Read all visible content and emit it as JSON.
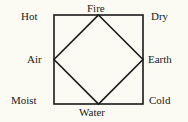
{
  "diagram": {
    "corners": {
      "top_left": "Hot",
      "top_right": "Dry",
      "bottom_left": "Moist",
      "bottom_right": "Cold"
    },
    "midpoints": {
      "top": "Fire",
      "right": "Earth",
      "bottom": "Water",
      "left": "Air"
    },
    "colors": {
      "background": "#fbfaf3",
      "line": "#1a1a1a"
    }
  }
}
